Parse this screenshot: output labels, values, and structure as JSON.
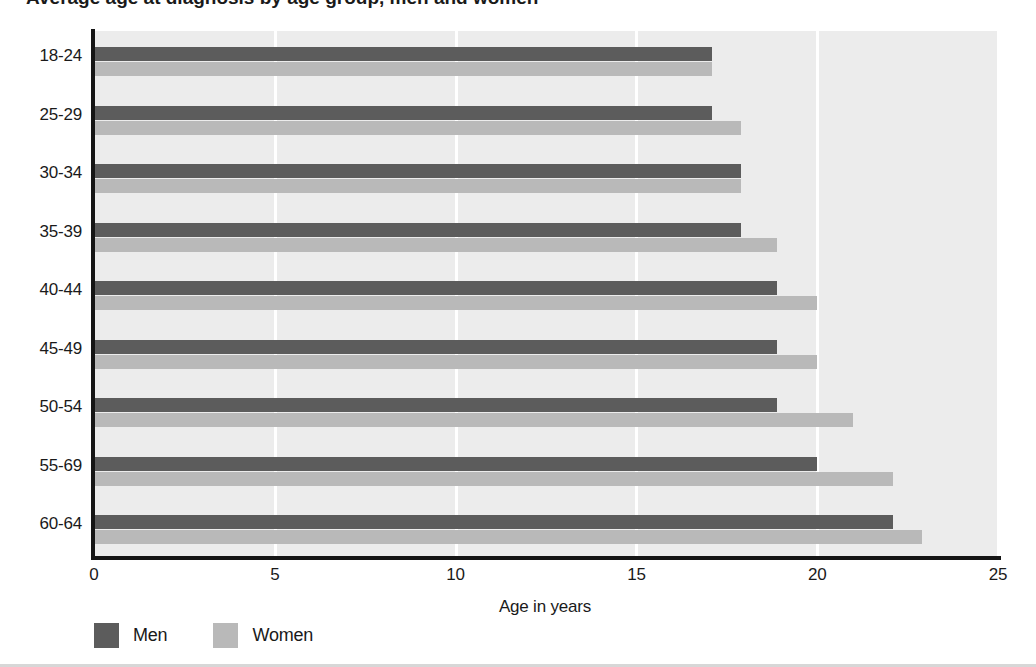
{
  "title": {
    "text": "Average age at diagnosis by age group, men and women",
    "clipped": true
  },
  "chart_data": {
    "type": "bar",
    "orientation": "horizontal",
    "title": "",
    "xlabel": "Age in years",
    "ylabel": "",
    "xlim": [
      0,
      25
    ],
    "xticks": [
      "0",
      "5",
      "10",
      "15",
      "20",
      "25"
    ],
    "xtick_values": [
      0,
      5,
      10,
      15,
      20,
      25
    ],
    "grid": "vertical",
    "legend_position": "bottom-left",
    "categories": [
      "18-24",
      "25-29",
      "30-34",
      "35-39",
      "40-44",
      "45-49",
      "50-54",
      "55-69",
      "60-64"
    ],
    "series": [
      {
        "name": "Men",
        "color": "#5c5c5c",
        "values": [
          17.1,
          17.1,
          17.9,
          17.9,
          18.9,
          18.9,
          18.9,
          20.0,
          22.1
        ]
      },
      {
        "name": "Women",
        "color": "#b9b9b9",
        "values": [
          17.1,
          17.9,
          17.9,
          18.9,
          20.0,
          20.0,
          21.0,
          22.1,
          22.9
        ]
      }
    ]
  },
  "colors": {
    "men": "#5c5c5c",
    "women": "#b9b9b9",
    "plot_background": "#ececec",
    "gridline": "#ffffff",
    "axis": "#151515",
    "text": "#1a1a1a",
    "page_background": "#ffffff"
  }
}
